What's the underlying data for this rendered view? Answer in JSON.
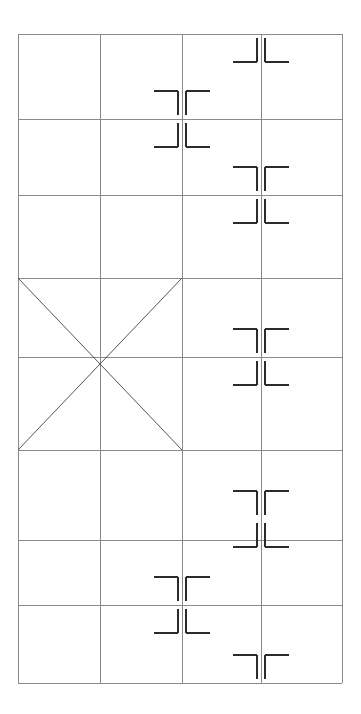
{
  "document": {
    "title": "Registration Mark Grid Layout",
    "canvas_width": 361,
    "canvas_height": 714,
    "background_color": "#ffffff"
  },
  "grid": {
    "name": "layout-grid",
    "left": 18,
    "top": 34,
    "right": 342,
    "bottom": 683,
    "stroke_color": "#8a8a8a",
    "stroke_width": 1,
    "column_count": 4,
    "row_count": 8,
    "column_edges": [
      18,
      100,
      182,
      261,
      342
    ],
    "row_edges": [
      34,
      119,
      195,
      278,
      357,
      450,
      540,
      605,
      683
    ],
    "column_widths": [
      82,
      82,
      79,
      81
    ],
    "row_heights": [
      85,
      76,
      83,
      79,
      93,
      90,
      65,
      78
    ]
  },
  "diagonals": {
    "name": "crossed-box-diagonals",
    "stroke_color": "#555555",
    "stroke_width": 1,
    "region": {
      "left": 18,
      "top": 278,
      "right": 182,
      "bottom": 450
    },
    "lines": [
      {
        "label": "diagonal-top-left-to-bottom-right",
        "x1": 18,
        "y1": 278,
        "x2": 182,
        "y2": 450
      },
      {
        "label": "diagonal-bottom-left-to-top-right",
        "x1": 18,
        "y1": 450,
        "x2": 182,
        "y2": 278
      }
    ]
  },
  "registration_marks": {
    "stroke_color": "#2b2b2b",
    "stroke_width": 2,
    "arm_length": 24,
    "gap": 4,
    "items": [
      {
        "id": "mark-1",
        "label": "registration-mark-full",
        "cx": 182,
        "cy": 119,
        "variant": "full",
        "quadrants": [
          "top-left",
          "top-right",
          "bottom-left",
          "bottom-right"
        ]
      },
      {
        "id": "mark-2",
        "label": "registration-mark-bottom-half",
        "cx": 261,
        "cy": 34,
        "variant": "bottom-half",
        "quadrants": [
          "bottom-left",
          "bottom-right"
        ]
      },
      {
        "id": "mark-3",
        "label": "registration-mark-full",
        "cx": 261,
        "cy": 195,
        "variant": "full",
        "quadrants": [
          "top-left",
          "top-right",
          "bottom-left",
          "bottom-right"
        ]
      },
      {
        "id": "mark-4",
        "label": "registration-mark-full",
        "cx": 261,
        "cy": 357,
        "variant": "full",
        "quadrants": [
          "top-left",
          "top-right",
          "bottom-left",
          "bottom-right"
        ]
      },
      {
        "id": "mark-5",
        "label": "registration-mark-full",
        "cx": 261,
        "cy": 519,
        "variant": "full",
        "quadrants": [
          "top-left",
          "top-right",
          "bottom-left",
          "bottom-right"
        ]
      },
      {
        "id": "mark-6",
        "label": "registration-mark-full",
        "cx": 182,
        "cy": 605,
        "variant": "full",
        "quadrants": [
          "top-left",
          "top-right",
          "bottom-left",
          "bottom-right"
        ]
      },
      {
        "id": "mark-7",
        "label": "registration-mark-top-half",
        "cx": 261,
        "cy": 683,
        "variant": "top-half",
        "quadrants": [
          "top-left",
          "top-right"
        ]
      }
    ]
  }
}
